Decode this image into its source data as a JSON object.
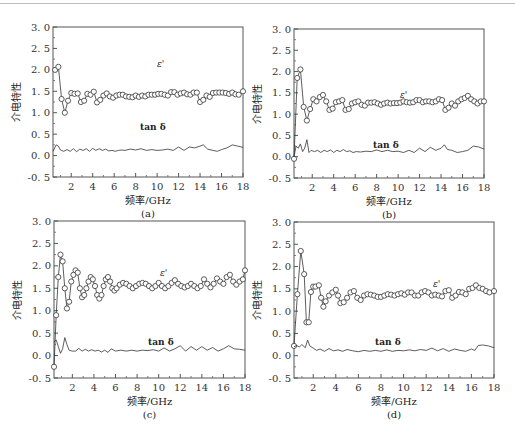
{
  "figure_caption": "",
  "chart_data": [
    {
      "id": "a",
      "type": "line",
      "panel_label": "(a)",
      "xlabel": "频率/GHz",
      "ylabel": "介电特性",
      "xlim": [
        0.3,
        18
      ],
      "ylim": [
        -0.5,
        3.0
      ],
      "xticks": [
        2,
        4,
        6,
        8,
        10,
        12,
        14,
        16,
        18
      ],
      "yticks": [
        "-0.5",
        "0.0",
        "0.5",
        "1.0",
        "1.5",
        "2.0",
        "2.5",
        "3.0"
      ],
      "annotations": [
        "ε'",
        "tan δ"
      ],
      "series": [
        {
          "name": "ε'",
          "marker": "circle",
          "x": [
            0.5,
            0.8,
            1.1,
            1.4,
            1.7,
            2.0,
            2.3,
            2.6,
            2.9,
            3.2,
            3.5,
            3.8,
            4.1,
            4.4,
            4.7,
            5.0,
            5.3,
            5.6,
            5.9,
            6.2,
            6.5,
            6.8,
            7.1,
            7.4,
            7.7,
            8.0,
            8.3,
            8.6,
            8.9,
            9.2,
            9.5,
            9.8,
            10.1,
            10.4,
            10.7,
            11.0,
            11.3,
            11.6,
            11.9,
            12.2,
            12.5,
            12.8,
            13.1,
            13.4,
            13.7,
            14.0,
            14.3,
            14.6,
            14.9,
            15.2,
            15.5,
            15.8,
            16.1,
            16.4,
            16.7,
            17.0,
            17.3,
            17.6,
            18.0
          ],
          "y": [
            2.0,
            2.07,
            1.32,
            1.0,
            1.28,
            1.46,
            1.44,
            1.45,
            1.25,
            1.28,
            1.44,
            1.42,
            1.49,
            1.24,
            1.3,
            1.4,
            1.45,
            1.38,
            1.35,
            1.4,
            1.42,
            1.42,
            1.38,
            1.37,
            1.36,
            1.4,
            1.37,
            1.4,
            1.38,
            1.42,
            1.42,
            1.42,
            1.44,
            1.44,
            1.42,
            1.4,
            1.48,
            1.48,
            1.42,
            1.45,
            1.47,
            1.43,
            1.42,
            1.47,
            1.47,
            1.25,
            1.3,
            1.4,
            1.37,
            1.46,
            1.47,
            1.47,
            1.47,
            1.46,
            1.44,
            1.47,
            1.43,
            1.42,
            1.5
          ]
        },
        {
          "name": "tan δ",
          "marker": "none",
          "x": [
            0.3,
            0.6,
            0.8,
            1.0,
            1.3,
            1.6,
            1.9,
            2.2,
            2.5,
            2.8,
            3.1,
            3.4,
            3.7,
            4.0,
            4.3,
            4.6,
            4.9,
            5.2,
            5.5,
            5.8,
            6.1,
            6.4,
            6.7,
            7.0,
            7.5,
            8.0,
            8.5,
            9.0,
            9.5,
            10.0,
            10.5,
            11.0,
            11.5,
            12.0,
            12.5,
            13.0,
            13.5,
            14.0,
            14.3,
            14.7,
            15.2,
            15.6,
            16.0,
            16.5,
            17.0,
            17.5,
            18.0
          ],
          "y": [
            0.1,
            0.25,
            0.22,
            0.13,
            0.1,
            0.14,
            0.1,
            0.16,
            0.09,
            0.15,
            0.12,
            0.16,
            0.1,
            0.17,
            0.12,
            0.16,
            0.12,
            0.15,
            0.11,
            0.12,
            0.1,
            0.12,
            0.13,
            0.12,
            0.15,
            0.13,
            0.16,
            0.12,
            0.14,
            0.12,
            0.13,
            0.15,
            0.12,
            0.2,
            0.12,
            0.2,
            0.18,
            0.22,
            0.25,
            0.15,
            0.12,
            0.1,
            0.14,
            0.18,
            0.25,
            0.22,
            0.19
          ]
        }
      ]
    },
    {
      "id": "b",
      "type": "line",
      "panel_label": "(b)",
      "xlabel": "频率/GHz",
      "ylabel": "介电特性",
      "xlim": [
        0.3,
        18
      ],
      "ylim": [
        -0.5,
        3.0
      ],
      "xticks": [
        2,
        4,
        6,
        8,
        10,
        12,
        14,
        16,
        18
      ],
      "yticks": [
        "-0.5",
        "0.0",
        "0.5",
        "1.0",
        "1.5",
        "2.0",
        "2.5",
        "3.0"
      ],
      "annotations": [
        "ε'",
        "tan δ"
      ],
      "series": [
        {
          "name": "ε'",
          "marker": "circle",
          "x": [
            0.3,
            0.6,
            0.9,
            1.2,
            1.5,
            1.8,
            2.1,
            2.4,
            2.7,
            3.0,
            3.3,
            3.6,
            3.9,
            4.2,
            4.5,
            4.8,
            5.1,
            5.4,
            5.7,
            6.0,
            6.3,
            6.6,
            6.9,
            7.2,
            7.5,
            7.8,
            8.1,
            8.4,
            8.7,
            9.0,
            9.3,
            9.6,
            9.9,
            10.2,
            10.5,
            10.8,
            11.1,
            11.4,
            11.7,
            12.0,
            12.3,
            12.6,
            12.9,
            13.2,
            13.5,
            13.8,
            14.1,
            14.4,
            14.7,
            15.0,
            15.3,
            15.6,
            15.9,
            16.2,
            16.5,
            16.8,
            17.1,
            17.4,
            17.7,
            18.0
          ],
          "y": [
            -0.05,
            1.85,
            2.05,
            1.17,
            0.85,
            1.12,
            1.35,
            1.3,
            1.4,
            1.45,
            1.3,
            1.1,
            1.13,
            1.28,
            1.3,
            1.33,
            1.1,
            1.12,
            1.25,
            1.28,
            1.3,
            1.22,
            1.2,
            1.27,
            1.27,
            1.28,
            1.25,
            1.22,
            1.25,
            1.27,
            1.25,
            1.26,
            1.26,
            1.27,
            1.3,
            1.28,
            1.27,
            1.28,
            1.33,
            1.33,
            1.28,
            1.3,
            1.3,
            1.28,
            1.3,
            1.35,
            1.33,
            1.1,
            1.15,
            1.25,
            1.2,
            1.3,
            1.35,
            1.38,
            1.43,
            1.35,
            1.3,
            1.25,
            1.3,
            1.3
          ]
        },
        {
          "name": "tan δ",
          "marker": "none",
          "x": [
            0.3,
            0.5,
            0.7,
            0.9,
            1.1,
            1.3,
            1.5,
            1.7,
            1.9,
            2.2,
            2.5,
            2.8,
            3.1,
            3.4,
            3.7,
            4.0,
            4.3,
            4.6,
            4.9,
            5.2,
            5.5,
            5.8,
            6.1,
            6.5,
            7.0,
            7.5,
            8.0,
            8.5,
            9.0,
            9.5,
            10.0,
            10.5,
            11.0,
            11.5,
            12.0,
            12.5,
            13.0,
            13.5,
            14.0,
            14.3,
            14.6,
            15.0,
            15.5,
            16.0,
            16.5,
            17.0,
            17.5,
            18.0
          ],
          "y": [
            0.0,
            0.25,
            0.2,
            0.3,
            0.12,
            0.2,
            0.4,
            0.1,
            0.15,
            0.12,
            0.15,
            0.1,
            0.15,
            0.12,
            0.16,
            0.1,
            0.15,
            0.12,
            0.17,
            0.12,
            0.14,
            0.1,
            0.12,
            0.11,
            0.13,
            0.12,
            0.16,
            0.12,
            0.15,
            0.12,
            0.13,
            0.1,
            0.15,
            0.1,
            0.2,
            0.12,
            0.22,
            0.15,
            0.2,
            0.28,
            0.17,
            0.15,
            0.1,
            0.12,
            0.15,
            0.25,
            0.23,
            0.18
          ]
        }
      ]
    },
    {
      "id": "c",
      "type": "line",
      "panel_label": "(c)",
      "xlabel": "频率/GHz",
      "ylabel": "介电特性",
      "xlim": [
        0.3,
        18
      ],
      "ylim": [
        -0.5,
        3.0
      ],
      "xticks": [
        2,
        4,
        6,
        8,
        10,
        12,
        14,
        16,
        18
      ],
      "yticks": [
        "-0.5",
        "0.0",
        "0.5",
        "1.0",
        "1.5",
        "2.0",
        "2.5",
        "3.0"
      ],
      "annotations": [
        "ε'",
        "tan δ"
      ],
      "series": [
        {
          "name": "ε'",
          "marker": "circle",
          "generator": "damped oscillation",
          "x": [
            0.3,
            0.5,
            0.7,
            0.9,
            1.1,
            1.3,
            1.5,
            1.7,
            1.9,
            2.1,
            2.3,
            2.5,
            2.7,
            2.9,
            3.1,
            3.3,
            3.5,
            3.7,
            3.9,
            4.1,
            4.3,
            4.5,
            4.7,
            4.9,
            5.1,
            5.3,
            5.5,
            5.7,
            5.9,
            6.1,
            6.4,
            6.7,
            7.0,
            7.3,
            7.6,
            7.9,
            8.2,
            8.5,
            8.8,
            9.1,
            9.4,
            9.7,
            10.0,
            10.3,
            10.6,
            10.9,
            11.2,
            11.5,
            11.8,
            12.1,
            12.4,
            12.7,
            13.0,
            13.3,
            13.6,
            13.9,
            14.2,
            14.5,
            14.8,
            15.1,
            15.4,
            15.7,
            16.0,
            16.3,
            16.6,
            16.9,
            17.2,
            17.5,
            17.8,
            18.0
          ],
          "y": [
            -0.25,
            0.9,
            1.75,
            2.25,
            2.1,
            1.5,
            1.05,
            1.2,
            1.65,
            1.8,
            1.9,
            1.85,
            1.5,
            1.3,
            1.35,
            1.5,
            1.65,
            1.75,
            1.7,
            1.55,
            1.35,
            1.27,
            1.35,
            1.55,
            1.7,
            1.75,
            1.65,
            1.5,
            1.45,
            1.5,
            1.58,
            1.62,
            1.6,
            1.55,
            1.5,
            1.55,
            1.6,
            1.62,
            1.6,
            1.55,
            1.5,
            1.55,
            1.62,
            1.55,
            1.5,
            1.55,
            1.62,
            1.68,
            1.6,
            1.55,
            1.52,
            1.55,
            1.6,
            1.55,
            1.5,
            1.55,
            1.7,
            1.6,
            1.52,
            1.6,
            1.72,
            1.65,
            1.6,
            1.75,
            1.8,
            1.65,
            1.58,
            1.65,
            1.7,
            1.9
          ]
        },
        {
          "name": "tan δ",
          "marker": "none",
          "x": [
            0.3,
            0.5,
            0.7,
            0.9,
            1.1,
            1.3,
            1.5,
            1.7,
            2.0,
            2.3,
            2.6,
            2.9,
            3.2,
            3.5,
            3.8,
            4.1,
            4.4,
            4.7,
            5.0,
            5.3,
            5.6,
            6.0,
            6.5,
            7.0,
            7.5,
            8.0,
            8.5,
            9.0,
            9.5,
            10.0,
            10.5,
            11.0,
            11.5,
            12.0,
            12.5,
            13.0,
            13.5,
            14.0,
            14.5,
            15.0,
            15.5,
            16.0,
            16.5,
            17.0,
            17.5,
            18.0
          ],
          "y": [
            0.3,
            0.35,
            0.2,
            0.05,
            0.15,
            0.4,
            0.25,
            0.12,
            0.1,
            0.1,
            0.16,
            0.1,
            0.14,
            0.1,
            0.13,
            0.1,
            0.12,
            0.08,
            0.12,
            0.07,
            0.15,
            0.1,
            0.12,
            0.1,
            0.12,
            0.1,
            0.12,
            0.11,
            0.13,
            0.1,
            0.17,
            0.1,
            0.15,
            0.22,
            0.1,
            0.2,
            0.12,
            0.2,
            0.12,
            0.18,
            0.1,
            0.15,
            0.22,
            0.15,
            0.14,
            0.12
          ]
        }
      ]
    },
    {
      "id": "d",
      "type": "line",
      "panel_label": "(d)",
      "xlabel": "频率/GHz",
      "ylabel": "介电特性",
      "xlim": [
        0.3,
        18
      ],
      "ylim": [
        -0.5,
        3.0
      ],
      "xticks": [
        2,
        4,
        6,
        8,
        10,
        12,
        14,
        16,
        18
      ],
      "yticks": [
        "-0.5",
        "0.0",
        "0.5",
        "1.0",
        "1.5",
        "2.0",
        "2.5",
        "3.0"
      ],
      "annotations": [
        "ε'",
        "tan δ"
      ],
      "series": [
        {
          "name": "ε'",
          "marker": "circle",
          "x": [
            0.3,
            0.6,
            0.9,
            1.2,
            1.4,
            1.6,
            1.8,
            2.0,
            2.2,
            2.5,
            2.7,
            2.9,
            3.1,
            3.4,
            3.7,
            4.0,
            4.2,
            4.4,
            4.7,
            5.0,
            5.3,
            5.6,
            5.9,
            6.2,
            6.5,
            6.8,
            7.1,
            7.4,
            7.7,
            8.0,
            8.3,
            8.6,
            8.9,
            9.2,
            9.5,
            9.8,
            10.1,
            10.4,
            10.7,
            11.0,
            11.3,
            11.6,
            11.9,
            12.2,
            12.5,
            12.8,
            13.1,
            13.4,
            13.7,
            14.0,
            14.3,
            14.6,
            14.9,
            15.2,
            15.5,
            15.8,
            16.1,
            16.4,
            16.7,
            17.0,
            17.3,
            17.6,
            18.0
          ],
          "y": [
            0.22,
            1.38,
            2.35,
            1.83,
            0.75,
            0.75,
            1.43,
            1.55,
            1.55,
            1.58,
            1.3,
            1.1,
            1.22,
            1.35,
            1.42,
            1.48,
            1.35,
            1.18,
            1.2,
            1.3,
            1.42,
            1.45,
            1.3,
            1.25,
            1.35,
            1.38,
            1.37,
            1.35,
            1.32,
            1.32,
            1.35,
            1.38,
            1.37,
            1.35,
            1.38,
            1.4,
            1.37,
            1.42,
            1.42,
            1.35,
            1.35,
            1.42,
            1.45,
            1.42,
            1.35,
            1.37,
            1.35,
            1.33,
            1.45,
            1.47,
            1.3,
            1.35,
            1.43,
            1.42,
            1.38,
            1.5,
            1.52,
            1.58,
            1.52,
            1.5,
            1.45,
            1.42,
            1.45
          ]
        },
        {
          "name": "tan δ",
          "marker": "none",
          "x": [
            0.3,
            0.5,
            0.8,
            1.0,
            1.3,
            1.5,
            1.7,
            2.0,
            2.3,
            2.6,
            3.0,
            3.4,
            3.8,
            4.2,
            4.6,
            5.0,
            5.5,
            6.0,
            6.5,
            7.0,
            7.5,
            8.0,
            8.5,
            9.0,
            9.5,
            10.0,
            10.5,
            11.0,
            11.5,
            12.0,
            12.5,
            13.0,
            13.5,
            14.0,
            14.5,
            15.0,
            15.5,
            16.0,
            16.3,
            16.6,
            17.0,
            17.5,
            18.0
          ],
          "y": [
            0.2,
            0.23,
            0.2,
            0.25,
            0.18,
            0.35,
            0.22,
            0.17,
            0.12,
            0.15,
            0.1,
            0.16,
            0.11,
            0.13,
            0.1,
            0.14,
            0.11,
            0.09,
            0.12,
            0.1,
            0.12,
            0.1,
            0.13,
            0.1,
            0.12,
            0.11,
            0.13,
            0.11,
            0.14,
            0.12,
            0.17,
            0.11,
            0.16,
            0.1,
            0.15,
            0.12,
            0.1,
            0.15,
            0.12,
            0.23,
            0.24,
            0.22,
            0.18
          ]
        }
      ]
    }
  ]
}
